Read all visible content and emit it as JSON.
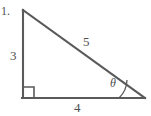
{
  "figure": {
    "problem_number": "1.",
    "stroke_color": "#5a5a5a",
    "text_color": "#4f4f4f",
    "background_color": "#ffffff",
    "labels": {
      "vertical_leg": "3",
      "horizontal_leg": "4",
      "hypotenuse": "5",
      "angle": "θ"
    },
    "markers": {
      "right_angle_symbol": "right-angle-square",
      "angle_arc_symbol": "angle-arc"
    },
    "geometry": {
      "apex": [
        23,
        10
      ],
      "right_angle_vertex": [
        23,
        98
      ],
      "angle_vertex": [
        144,
        98
      ]
    }
  }
}
